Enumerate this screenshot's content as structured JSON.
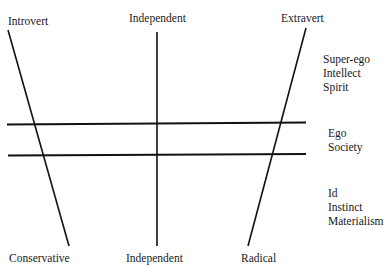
{
  "diagram": {
    "top_labels": {
      "left": "Introvert",
      "center": "Independent",
      "right": "Extravert"
    },
    "bottom_labels": {
      "left": "Conservative",
      "center": "Independent",
      "right": "Radical"
    },
    "right_groups": {
      "upper": [
        "Super-ego",
        "Intellect",
        "Spirit"
      ],
      "middle": [
        "Ego",
        "Society"
      ],
      "lower": [
        "Id",
        "Instinct",
        "Materialism"
      ]
    },
    "line_color": "#111111"
  }
}
